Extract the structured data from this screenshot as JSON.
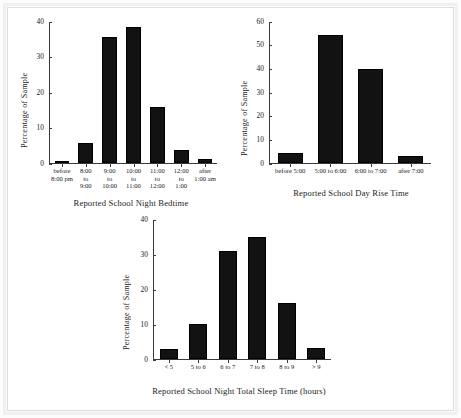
{
  "chart_data": [
    {
      "type": "bar",
      "name": "bedtime",
      "title": "",
      "xlabel": "Reported School Night Bedtime",
      "ylabel": "Percentage of Sample",
      "categories": [
        "before\n8:00 pm",
        "8:00\nto\n9:00",
        "9:00\nto\n10:00",
        "10:00\nto\n11:00",
        "11:00\nto\n12:00",
        "12:00\nto\n1:00",
        "after\n1:00 am"
      ],
      "values": [
        0.5,
        5.8,
        35.8,
        38.6,
        15.8,
        3.6,
        1.2
      ],
      "ylim": [
        0,
        40
      ],
      "yticks": [
        0,
        10,
        20,
        30,
        40
      ],
      "grid": false,
      "legend": "none"
    },
    {
      "type": "bar",
      "name": "rise-time",
      "title": "",
      "xlabel": "Reported School Day Rise Time",
      "ylabel": "Percentage of Sample",
      "categories": [
        "before 5:00",
        "5:00 to 6:00",
        "6:00 to 7:00",
        "after 7:00"
      ],
      "values": [
        4.2,
        54.6,
        40.2,
        2.8
      ],
      "ylim": [
        0,
        60
      ],
      "yticks": [
        0,
        10,
        20,
        30,
        40,
        50,
        60
      ],
      "grid": false,
      "legend": "none"
    },
    {
      "type": "bar",
      "name": "total-sleep-time",
      "title": "",
      "xlabel": "Reported School Night Total Sleep Time (hours)",
      "ylabel": "Percentage of Sample",
      "categories": [
        "< 5",
        "5 to 6",
        "6 to 7",
        "7 to 8",
        "8 to 9",
        "> 9"
      ],
      "values": [
        2.9,
        10.0,
        31.2,
        35.2,
        16.0,
        3.2
      ],
      "ylim": [
        0,
        40
      ],
      "yticks": [
        0,
        10,
        20,
        30,
        40
      ],
      "grid": false,
      "legend": "none"
    }
  ],
  "page": {
    "background_color": "#ffffff",
    "bar_color": "#121212",
    "axis_color": "#3a3a3a",
    "text_color": "#1d1d1d"
  }
}
